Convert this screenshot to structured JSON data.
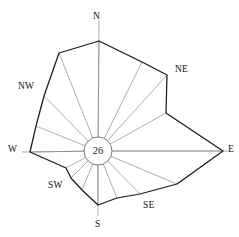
{
  "figure": {
    "name": "wind-rose-diagram",
    "background_color": "#ffffff",
    "line_color": "#1a1a1a",
    "spoke_color": "#8a8a8a",
    "center": {
      "x": 98,
      "y": 151
    },
    "hub": {
      "label": "26",
      "radius": 14
    }
  },
  "labels": {
    "n": "N",
    "ne": "NE",
    "e": "E",
    "se": "SE",
    "s": "S",
    "sw": "SW",
    "w": "W",
    "nw": "NW"
  },
  "chart_data": {
    "type": "line",
    "subtype": "wind-rose-polar",
    "title": "",
    "subtitle": "",
    "xlabel": "",
    "ylabel": "",
    "grid": false,
    "legend": "none",
    "center_value": 26,
    "center_value_label": "26",
    "hub_radius_px": 14,
    "axis_labels_shown": [
      "N",
      "NE",
      "E",
      "SE",
      "S",
      "SW",
      "W",
      "NW"
    ],
    "sector_count": 16,
    "categories": [
      "N",
      "NNE",
      "NE",
      "ENE",
      "E",
      "ESE",
      "SE",
      "SSE",
      "S",
      "SSW",
      "SW",
      "WSW",
      "W",
      "WNW",
      "NW",
      "NNW"
    ],
    "angles_deg": [
      0,
      22.5,
      45,
      67.5,
      90,
      112.5,
      135,
      157.5,
      180,
      202.5,
      225,
      247.5,
      270,
      292.5,
      315,
      337.5
    ],
    "values": [
      110,
      92,
      103,
      70,
      125,
      86,
      60,
      51,
      54,
      42,
      38,
      45,
      68,
      67,
      77,
      102
    ],
    "series": [
      {
        "name": "frequency",
        "values": [
          110,
          92,
          103,
          70,
          125,
          86,
          60,
          51,
          54,
          42,
          38,
          45,
          68,
          67,
          77,
          102
        ]
      }
    ],
    "vertices_px": [
      {
        "dir": "N",
        "x": 99,
        "y": 41
      },
      {
        "dir": "NNE",
        "x": 142,
        "y": 62
      },
      {
        "dir": "NE",
        "x": 167,
        "y": 75
      },
      {
        "dir": "ENE",
        "x": 166,
        "y": 113
      },
      {
        "dir": "E",
        "x": 223,
        "y": 151
      },
      {
        "dir": "ESE",
        "x": 177,
        "y": 184
      },
      {
        "dir": "SE",
        "x": 140,
        "y": 194
      },
      {
        "dir": "SSE",
        "x": 117,
        "y": 198
      },
      {
        "dir": "S",
        "x": 98,
        "y": 205
      },
      {
        "dir": "SSW",
        "x": 82,
        "y": 190
      },
      {
        "dir": "SW",
        "x": 71,
        "y": 178
      },
      {
        "dir": "WSW",
        "x": 66,
        "y": 168
      },
      {
        "dir": "W",
        "x": 30,
        "y": 152
      },
      {
        "dir": "WNW",
        "x": 36,
        "y": 126
      },
      {
        "dir": "NW",
        "x": 44,
        "y": 96
      },
      {
        "dir": "NNW",
        "x": 59,
        "y": 53
      }
    ],
    "axis_ray_ends_px": [
      {
        "dir": "N",
        "x": 99,
        "y": 20
      },
      {
        "dir": "E",
        "x": 228,
        "y": 151
      },
      {
        "dir": "S",
        "x": 98,
        "y": 216
      },
      {
        "dir": "W",
        "x": 22,
        "y": 152
      }
    ]
  },
  "label_positions": {
    "n": {
      "left": 93,
      "top": 11
    },
    "ne": {
      "left": 175,
      "top": 64
    },
    "e": {
      "left": 228,
      "top": 144
    },
    "se": {
      "left": 143,
      "top": 200
    },
    "s": {
      "left": 95,
      "top": 219
    },
    "sw": {
      "left": 48,
      "top": 180
    },
    "w": {
      "left": 8,
      "top": 144
    },
    "nw": {
      "left": 18,
      "top": 81
    }
  }
}
